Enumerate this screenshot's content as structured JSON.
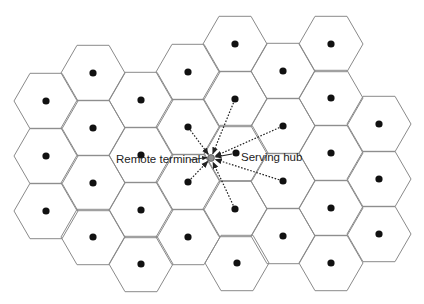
{
  "diagram": {
    "type": "hexagonal-cellular-grid",
    "hex_radius": 32,
    "colors": {
      "hex_stroke": "#8a8a8a",
      "site_dot": "#111111",
      "terminal": "#8f8f8f",
      "arrow": "#222222"
    },
    "cells": [
      {
        "x": 46,
        "y": 101
      },
      {
        "x": 46,
        "y": 156
      },
      {
        "x": 46,
        "y": 211
      },
      {
        "x": 93,
        "y": 73
      },
      {
        "x": 93,
        "y": 128
      },
      {
        "x": 93,
        "y": 183
      },
      {
        "x": 93,
        "y": 237
      },
      {
        "x": 141,
        "y": 100
      },
      {
        "x": 141,
        "y": 155
      },
      {
        "x": 141,
        "y": 210
      },
      {
        "x": 141,
        "y": 264
      },
      {
        "x": 188,
        "y": 72
      },
      {
        "x": 188,
        "y": 127
      },
      {
        "x": 188,
        "y": 182
      },
      {
        "x": 188,
        "y": 237
      },
      {
        "x": 235,
        "y": 44
      },
      {
        "x": 235,
        "y": 99
      },
      {
        "x": 236,
        "y": 153
      },
      {
        "x": 235,
        "y": 209
      },
      {
        "x": 237,
        "y": 263
      },
      {
        "x": 283,
        "y": 71
      },
      {
        "x": 283,
        "y": 126
      },
      {
        "x": 283,
        "y": 181
      },
      {
        "x": 283,
        "y": 236
      },
      {
        "x": 331,
        "y": 44
      },
      {
        "x": 331,
        "y": 98
      },
      {
        "x": 331,
        "y": 153
      },
      {
        "x": 331,
        "y": 208
      },
      {
        "x": 331,
        "y": 263
      },
      {
        "x": 379,
        "y": 124
      },
      {
        "x": 379,
        "y": 179
      },
      {
        "x": 379,
        "y": 234
      }
    ],
    "remote_terminal": {
      "x": 211,
      "y": 158
    },
    "serving_hub": {
      "x": 236,
      "y": 153
    },
    "interfering_links": [
      {
        "from": {
          "x": 188,
          "y": 127
        }
      },
      {
        "from": {
          "x": 235,
          "y": 99
        }
      },
      {
        "from": {
          "x": 283,
          "y": 126
        }
      },
      {
        "from": {
          "x": 283,
          "y": 181
        }
      },
      {
        "from": {
          "x": 235,
          "y": 209
        }
      },
      {
        "from": {
          "x": 188,
          "y": 182
        }
      }
    ],
    "labels": {
      "remote_terminal": "Remote terminal",
      "serving_hub": "Serving hub"
    }
  }
}
